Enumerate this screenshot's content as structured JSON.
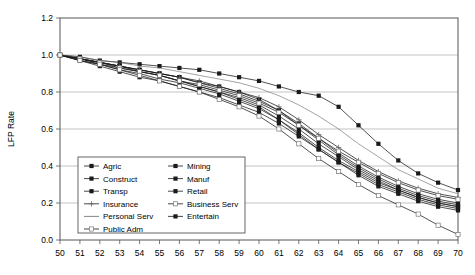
{
  "chart_data": {
    "type": "line",
    "title": "",
    "xlabel": "",
    "ylabel": "LFP Rate",
    "xlim": [
      50,
      70
    ],
    "ylim": [
      0.0,
      1.2
    ],
    "ytick_step": 0.2,
    "grid": "horizontal",
    "legend_position": "inside-bottom-left",
    "legend_columns": 2,
    "x": [
      50,
      51,
      52,
      53,
      54,
      55,
      56,
      57,
      58,
      59,
      60,
      61,
      62,
      63,
      64,
      65,
      66,
      67,
      68,
      69,
      70
    ],
    "ytick_labels": [
      "0.0",
      "0.2",
      "0.4",
      "0.6",
      "0.8",
      "1.0",
      "1.2"
    ],
    "xtick_labels": [
      "50",
      "51",
      "52",
      "53",
      "54",
      "55",
      "56",
      "57",
      "58",
      "59",
      "60",
      "61",
      "62",
      "63",
      "64",
      "65",
      "66",
      "67",
      "68",
      "69",
      "70"
    ],
    "series": [
      {
        "name": "Agric",
        "marker": "filled-square",
        "values": [
          1.0,
          0.99,
          0.97,
          0.96,
          0.95,
          0.94,
          0.93,
          0.92,
          0.9,
          0.88,
          0.86,
          0.83,
          0.8,
          0.78,
          0.72,
          0.62,
          0.52,
          0.43,
          0.36,
          0.31,
          0.27
        ]
      },
      {
        "name": "Mining",
        "marker": "filled-square",
        "values": [
          1.0,
          0.98,
          0.96,
          0.94,
          0.92,
          0.9,
          0.88,
          0.85,
          0.82,
          0.79,
          0.75,
          0.7,
          0.63,
          0.55,
          0.47,
          0.4,
          0.34,
          0.29,
          0.25,
          0.22,
          0.2
        ]
      },
      {
        "name": "Construct",
        "marker": "filled-square",
        "values": [
          1.0,
          0.98,
          0.95,
          0.93,
          0.91,
          0.89,
          0.86,
          0.83,
          0.8,
          0.77,
          0.73,
          0.67,
          0.6,
          0.52,
          0.45,
          0.38,
          0.32,
          0.27,
          0.23,
          0.2,
          0.18
        ]
      },
      {
        "name": "Manuf",
        "marker": "filled-square",
        "values": [
          1.0,
          0.98,
          0.96,
          0.94,
          0.92,
          0.9,
          0.88,
          0.85,
          0.83,
          0.8,
          0.76,
          0.7,
          0.62,
          0.54,
          0.46,
          0.39,
          0.33,
          0.28,
          0.24,
          0.21,
          0.19
        ]
      },
      {
        "name": "Transp",
        "marker": "filled-square",
        "values": [
          1.0,
          0.98,
          0.96,
          0.94,
          0.91,
          0.89,
          0.86,
          0.83,
          0.8,
          0.76,
          0.72,
          0.65,
          0.57,
          0.49,
          0.42,
          0.35,
          0.29,
          0.25,
          0.21,
          0.18,
          0.16
        ]
      },
      {
        "name": "Retail",
        "marker": "filled-square",
        "values": [
          1.0,
          0.97,
          0.95,
          0.92,
          0.9,
          0.87,
          0.85,
          0.82,
          0.79,
          0.75,
          0.71,
          0.65,
          0.58,
          0.5,
          0.43,
          0.37,
          0.31,
          0.27,
          0.23,
          0.2,
          0.18
        ]
      },
      {
        "name": "Insurance",
        "marker": "plus",
        "values": [
          1.0,
          0.98,
          0.96,
          0.94,
          0.92,
          0.9,
          0.88,
          0.86,
          0.83,
          0.8,
          0.77,
          0.72,
          0.65,
          0.57,
          0.5,
          0.43,
          0.37,
          0.32,
          0.28,
          0.25,
          0.23
        ]
      },
      {
        "name": "Business Serv",
        "marker": "open-square",
        "values": [
          1.0,
          0.98,
          0.96,
          0.93,
          0.91,
          0.89,
          0.86,
          0.84,
          0.81,
          0.78,
          0.74,
          0.69,
          0.62,
          0.55,
          0.48,
          0.42,
          0.36,
          0.31,
          0.27,
          0.24,
          0.22
        ]
      },
      {
        "name": "Personal Serv",
        "marker": "none",
        "values": [
          1.0,
          0.99,
          0.97,
          0.96,
          0.94,
          0.93,
          0.91,
          0.89,
          0.87,
          0.85,
          0.82,
          0.78,
          0.73,
          0.67,
          0.6,
          0.52,
          0.45,
          0.38,
          0.33,
          0.28,
          0.25
        ]
      },
      {
        "name": "Entertain",
        "marker": "filled-square",
        "values": [
          1.0,
          0.97,
          0.94,
          0.91,
          0.88,
          0.86,
          0.83,
          0.8,
          0.77,
          0.73,
          0.69,
          0.63,
          0.56,
          0.49,
          0.42,
          0.36,
          0.3,
          0.26,
          0.22,
          0.19,
          0.17
        ]
      },
      {
        "name": "Public Adm",
        "marker": "open-square",
        "values": [
          1.0,
          0.97,
          0.95,
          0.92,
          0.89,
          0.86,
          0.83,
          0.8,
          0.76,
          0.72,
          0.67,
          0.6,
          0.52,
          0.44,
          0.37,
          0.3,
          0.24,
          0.19,
          0.14,
          0.08,
          0.03
        ]
      }
    ]
  },
  "legend": {
    "entries": [
      {
        "label": "Agric"
      },
      {
        "label": "Mining"
      },
      {
        "label": "Construct"
      },
      {
        "label": "Manuf"
      },
      {
        "label": "Transp"
      },
      {
        "label": "Retail"
      },
      {
        "label": "Insurance"
      },
      {
        "label": "Business Serv"
      },
      {
        "label": "Personal Serv"
      },
      {
        "label": "Entertain"
      },
      {
        "label": "Public Adm"
      }
    ]
  },
  "colors": {
    "line": "#1a1a1a",
    "grid": "#aaaaaa",
    "axis": "#555555",
    "background": "#ffffff"
  }
}
